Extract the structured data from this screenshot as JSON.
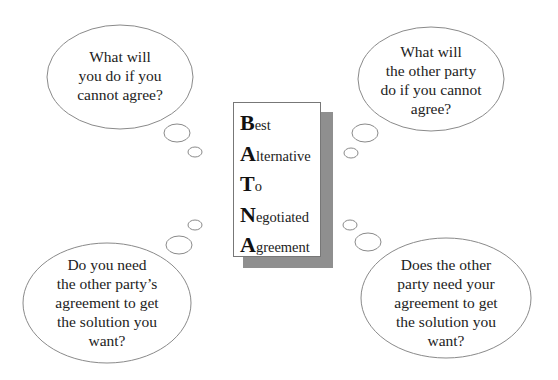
{
  "acronym": {
    "rows": [
      {
        "initial": "B",
        "rest": "est"
      },
      {
        "initial": "A",
        "rest": "lternative"
      },
      {
        "initial": "T",
        "rest": "o"
      },
      {
        "initial": "N",
        "rest": "egotiated"
      },
      {
        "initial": "A",
        "rest": "greement"
      }
    ]
  },
  "clouds": {
    "top_left": {
      "lines": [
        "What will",
        "you do if you",
        "cannot agree?"
      ]
    },
    "top_right": {
      "lines": [
        "What will",
        "the other party",
        "do if you cannot",
        "agree?"
      ]
    },
    "bottom_left": {
      "lines": [
        "Do you need",
        "the other party’s",
        "agreement to get",
        "the solution you",
        "want?"
      ]
    },
    "bottom_right": {
      "lines": [
        "Does the other",
        "party need your",
        "agreement to get",
        "the solution you",
        "want?"
      ]
    }
  },
  "colors": {
    "outline": "#777777",
    "shadow": "#8f8f8f"
  }
}
